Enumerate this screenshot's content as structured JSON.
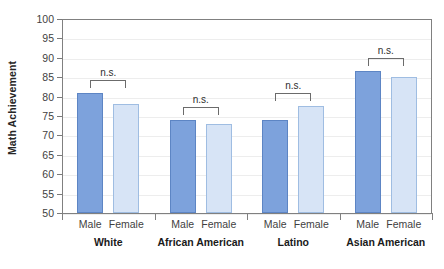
{
  "chart_data": {
    "type": "bar",
    "title": "",
    "subtitle": "",
    "xlabel": "",
    "ylabel": "Math Achievement",
    "ylim": [
      50,
      100
    ],
    "ytick_step": 5,
    "yticks": [
      50,
      55,
      60,
      65,
      70,
      75,
      80,
      85,
      90,
      95,
      100
    ],
    "grid": true,
    "legend": "none",
    "categories": [
      "White",
      "African American",
      "Latino",
      "Asian American"
    ],
    "subcategories": [
      "Male",
      "Female"
    ],
    "series": [
      {
        "name": "Male",
        "values": [
          81.0,
          74.0,
          74.0,
          86.5
        ]
      },
      {
        "name": "Female",
        "values": [
          78.0,
          73.0,
          77.5,
          85.0
        ]
      }
    ],
    "annotations": [
      {
        "group": "White",
        "text": "n.s."
      },
      {
        "group": "African American",
        "text": "n.s."
      },
      {
        "group": "Latino",
        "text": "n.s."
      },
      {
        "group": "Asian American",
        "text": "n.s."
      }
    ],
    "colors": {
      "male_fill": "#7da2dc",
      "male_edge": "#5d85c4",
      "female_fill": "#d7e4f6",
      "female_edge": "#9fbde2",
      "axis": "#808080",
      "grid": "#ededed",
      "text": "#3f3f3f"
    }
  }
}
